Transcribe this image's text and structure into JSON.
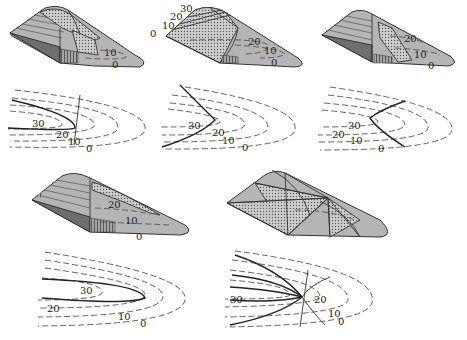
{
  "figure": {
    "panels": [
      {
        "id": "a",
        "surface_labels": [
          "10",
          "0"
        ],
        "contour_labels": [
          "30",
          "20",
          "10",
          "0"
        ]
      },
      {
        "id": "b",
        "surface_labels": [
          "30",
          "20",
          "10",
          "0",
          "20",
          "10",
          "0"
        ],
        "contour_labels": [
          "30",
          "20",
          "10",
          "0"
        ]
      },
      {
        "id": "c",
        "surface_labels": [
          "20",
          "10",
          "0"
        ],
        "contour_labels": [
          "30",
          "20",
          "10",
          "0"
        ]
      },
      {
        "id": "d",
        "surface_labels": [
          "20",
          "10",
          "0"
        ],
        "contour_labels": [
          "30",
          "20",
          "10",
          "0"
        ]
      },
      {
        "id": "e",
        "surface_labels": [],
        "contour_labels": [
          "30",
          "20",
          "10",
          "0"
        ]
      }
    ]
  },
  "colors": {
    "surface": "#b5b5b5",
    "shadow": "#6e6e6e",
    "line": "#333333",
    "dashed": "#555555"
  }
}
